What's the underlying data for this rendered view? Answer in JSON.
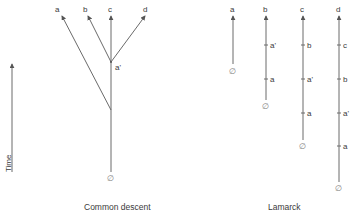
{
  "axis": {
    "label": "Time"
  },
  "common_descent": {
    "caption": "Common descent",
    "tips": [
      {
        "id": "a",
        "label": "a"
      },
      {
        "id": "b",
        "label": "b"
      },
      {
        "id": "c",
        "label": "c"
      },
      {
        "id": "d",
        "label": "d"
      }
    ],
    "node_label": "a'",
    "root_label": "∅"
  },
  "lamarck": {
    "caption": "Lamarck",
    "lineages": [
      {
        "top": "a",
        "stages": [],
        "root": "∅"
      },
      {
        "top": "b",
        "stages": [
          "a'",
          "a"
        ],
        "root": "∅"
      },
      {
        "top": "c",
        "stages": [
          "b",
          "a'",
          "a"
        ],
        "root": "∅"
      },
      {
        "top": "d",
        "stages": [
          "c",
          "b",
          "a'",
          "a"
        ],
        "root": "∅"
      }
    ]
  },
  "colors": {
    "line": "#6a6a6a",
    "text": "#3a3a3a",
    "background": "#ffffff"
  }
}
